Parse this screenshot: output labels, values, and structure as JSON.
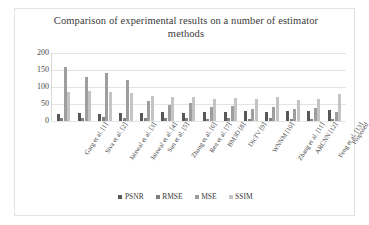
{
  "card": {
    "title": "Comparison of experimental results on a number of estimator methods"
  },
  "colors": {
    "psnr": "#585858",
    "rmse": "#808080",
    "mse": "#9e9e9e",
    "ssim": "#c4c4c4",
    "grid": "#e4e4e4",
    "border": "#e2e2e2",
    "text": "#3a3a3a"
  },
  "legend": {
    "position": "bottom",
    "items": [
      {
        "label": "PSNR",
        "color": "#585858"
      },
      {
        "label": "RMSE",
        "color": "#808080"
      },
      {
        "label": "MSE",
        "color": "#9e9e9e"
      },
      {
        "label": "SSIM",
        "color": "#c4c4c4"
      }
    ]
  },
  "chart_data": {
    "type": "bar",
    "title": "Comparison of experimental results on a number of estimator methods",
    "xlabel": "",
    "ylabel": "",
    "ylim": [
      0,
      200
    ],
    "yticks": [
      0,
      50,
      100,
      150,
      200
    ],
    "ytick_labels": [
      "0",
      "50",
      "100",
      "150",
      "200"
    ],
    "grid": true,
    "grid_axis": "y",
    "legend_position": "bottom",
    "categories": [
      "Garg et al. [1]",
      "Siva et al. [2]",
      "Jaiswal et al. [3]",
      "Jaiswal et al. [4]",
      "Sun et al. [5]",
      "Zhang et al. [6]",
      "Ren et al. [7]",
      "BM3D [8]",
      "DicTV [9]",
      "WNNM [10]",
      "Zhang et al. [11]",
      "ARCNN [12]",
      "Feng et al. [13]",
      "Proposed"
    ],
    "series": [
      {
        "name": "PSNR",
        "color": "#585858",
        "values": [
          22,
          23,
          21,
          24,
          25,
          26,
          24,
          27,
          26,
          28,
          27,
          29,
          28,
          31
        ]
      },
      {
        "name": "RMSE",
        "color": "#808080",
        "values": [
          10,
          9,
          11,
          8,
          9,
          8,
          9,
          7,
          8,
          7,
          8,
          6,
          7,
          5
        ]
      },
      {
        "name": "MSE",
        "color": "#9e9e9e",
        "values": [
          160,
          130,
          142,
          120,
          60,
          48,
          52,
          40,
          44,
          36,
          42,
          34,
          38,
          26
        ]
      },
      {
        "name": "SSIM",
        "color": "#c4c4c4",
        "values": [
          86,
          88,
          84,
          82,
          74,
          70,
          72,
          66,
          68,
          64,
          70,
          62,
          66,
          78
        ]
      }
    ]
  }
}
